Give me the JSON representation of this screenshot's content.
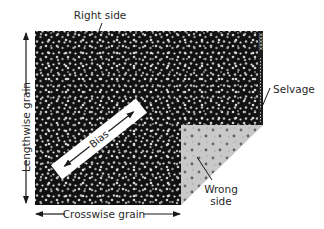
{
  "diagram": {
    "labels": {
      "right_side": "Right side",
      "selvage": "Selvage",
      "wrong_side": "Wrong side",
      "wrong_side_line1": "Wrong",
      "wrong_side_line2": "side",
      "lengthwise_grain": "Lengthwise grain",
      "crosswise_grain": "Crosswise grain",
      "bias": "Bias"
    },
    "selvage_marks": "XXXXX",
    "colors": {
      "fabric_right_side": "#111111",
      "fabric_dots": "#bdbdbd",
      "fabric_wrong_side": "#c8c8c8",
      "wrong_side_dots": "#6a6a6a",
      "bias_band": "#ffffff",
      "text": "#2a2a2a",
      "arrows": "#1a1a1a"
    },
    "geometry": {
      "fabric": {
        "x": 35,
        "y": 31,
        "width": 228,
        "height": 174
      },
      "fold_triangle": [
        [
          181,
          125
        ],
        [
          262,
          125
        ],
        [
          181,
          205
        ]
      ],
      "bias_band": {
        "from": [
          57,
          172
        ],
        "to": [
          141,
          106
        ],
        "width": 17
      }
    }
  }
}
